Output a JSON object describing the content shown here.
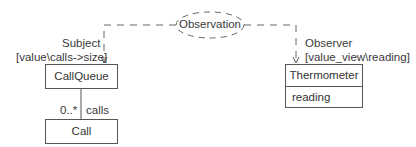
{
  "diagram": {
    "collaboration": {
      "label": "Observation"
    },
    "roles": {
      "subject": {
        "role": "Subject",
        "binding": "[value\\calls->size]"
      },
      "observer": {
        "role": "Observer",
        "binding": "[value_view\\reading]"
      }
    },
    "classes": [
      {
        "name": "CallQueue",
        "attributes": []
      },
      {
        "name": "Call",
        "attributes": []
      },
      {
        "name": "Thermometer",
        "attributes": [
          "reading"
        ]
      }
    ],
    "association": {
      "multiplicity": "0..*",
      "role_name": "calls"
    }
  }
}
